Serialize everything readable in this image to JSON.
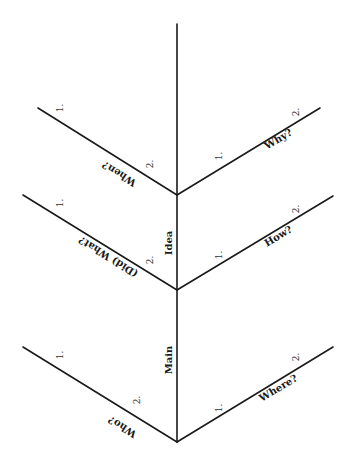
{
  "diagram": {
    "spine_labels": {
      "upper": "Idea",
      "lower": "Main"
    },
    "branches": {
      "top_left": {
        "label": "When?",
        "n1": "1.",
        "n2": "2."
      },
      "top_right": {
        "label": "Why?",
        "n1": "1.",
        "n2": "2."
      },
      "mid_left": {
        "label": "(Did) What?",
        "n1": "1.",
        "n2": "2."
      },
      "mid_right": {
        "label": "How?",
        "n1": "1.",
        "n2": "2."
      },
      "bottom_left": {
        "label": "Who?",
        "n1": "1.",
        "n2": "2."
      },
      "bottom_right": {
        "label": "Where?",
        "n1": "1.",
        "n2": "2."
      }
    },
    "colors": {
      "line": "#1a1a1a",
      "background": "#ffffff"
    }
  }
}
